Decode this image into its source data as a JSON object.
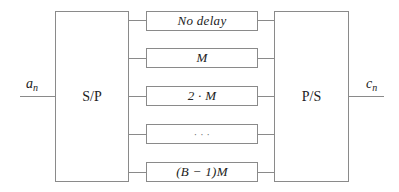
{
  "diagram": {
    "input_signal": {
      "base": "a",
      "sub": "n"
    },
    "output_signal": {
      "base": "c",
      "sub": "n"
    },
    "serial_to_parallel": {
      "label": "S/P"
    },
    "parallel_to_serial": {
      "label": "P/S"
    },
    "delay_lines": [
      {
        "label": "No delay"
      },
      {
        "label": "M"
      },
      {
        "label": "2 · M"
      },
      {
        "label": "· · ·"
      },
      {
        "label": "(B − 1)M"
      }
    ],
    "colors": {
      "stroke": "#8a8a8a",
      "text": "#222222",
      "background": "#ffffff"
    }
  }
}
